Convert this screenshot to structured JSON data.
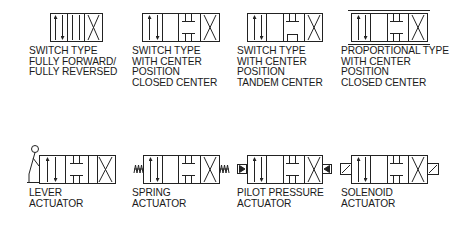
{
  "diagram": {
    "stroke_color": "#222222",
    "top_row": [
      {
        "id": "switch-full",
        "lines": [
          "SWITCH TYPE",
          "FULLY FORWARD/",
          "FULLY REVERSED"
        ]
      },
      {
        "id": "switch-closed-center",
        "lines": [
          "SWITCH TYPE",
          "WITH CENTER",
          "POSITION",
          "CLOSED CENTER"
        ]
      },
      {
        "id": "switch-tandem-center",
        "lines": [
          "SWITCH TYPE",
          "WITH CENTER",
          "POSITION",
          "TANDEM CENTER"
        ]
      },
      {
        "id": "proportional-closed-center",
        "lines": [
          "PROPORTIONAL TYPE",
          "WITH CENTER",
          "POSITION",
          "CLOSED CENTER"
        ]
      }
    ],
    "bottom_row": [
      {
        "id": "lever-actuator",
        "lines": [
          "LEVER",
          "ACTUATOR"
        ]
      },
      {
        "id": "spring-actuator",
        "lines": [
          "SPRING",
          "ACTUATOR"
        ]
      },
      {
        "id": "pilot-pressure-actuator",
        "lines": [
          "PILOT PRESSURE",
          "ACTUATOR"
        ]
      },
      {
        "id": "solenoid-actuator",
        "lines": [
          "SOLENOID",
          "ACTUATOR"
        ]
      }
    ]
  }
}
